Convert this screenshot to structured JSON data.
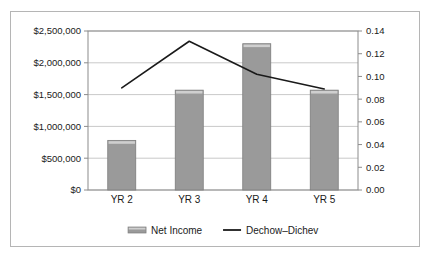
{
  "chart_data": {
    "type": "bar",
    "title": "",
    "subtitle": "",
    "xlabel": "",
    "ylabel": "",
    "categories": [
      "YR 2",
      "YR 3",
      "YR 4",
      "YR 5"
    ],
    "series": [
      {
        "name": "Net Income",
        "type": "bar",
        "axis": "left",
        "color": "#9a9a9a",
        "values": [
          780000,
          1570000,
          2300000,
          1570000
        ]
      },
      {
        "name": "Dechow–Dichev",
        "type": "line",
        "axis": "right",
        "color": "#1a1a1a",
        "values": [
          0.09,
          0.131,
          0.102,
          0.089
        ]
      }
    ],
    "left_axis": {
      "ylim": [
        0,
        2500000
      ],
      "tick_values": [
        0,
        500000,
        1000000,
        1500000,
        2000000,
        2500000
      ],
      "tick_labels": [
        "$0",
        "$500,000",
        "$1,000,000",
        "$1,500,000",
        "$2,000,000",
        "$2,500,000"
      ]
    },
    "right_axis": {
      "ylim": [
        0,
        0.14
      ],
      "tick_values": [
        0,
        0.02,
        0.04,
        0.06,
        0.08,
        0.1,
        0.12,
        0.14
      ],
      "tick_labels": [
        "0.00",
        "0.02",
        "0.04",
        "0.06",
        "0.08",
        "0.10",
        "0.12",
        "0.14"
      ]
    },
    "grid": true,
    "legend_position": "bottom",
    "legend": [
      {
        "label": "Net Income",
        "marker": "bar-swatch",
        "color": "#9a9a9a"
      },
      {
        "label": "Dechow–Dichev",
        "marker": "line-swatch",
        "color": "#1a1a1a"
      }
    ],
    "colors": {
      "bar_fill": "#9a9a9a",
      "bar_highlight": "#cfcfcf",
      "bar_stroke": "#7d7d7d",
      "line": "#1a1a1a",
      "grid": "#c9c9c9",
      "axis": "#8c8c8c",
      "frame": "#b5b5b5",
      "text": "#1a1a1a",
      "background": "#ffffff"
    }
  }
}
